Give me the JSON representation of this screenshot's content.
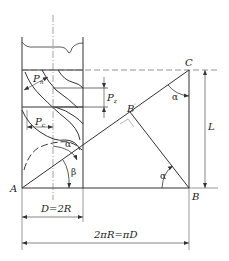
{
  "diagram": {
    "points": {
      "A": "A",
      "B": "B",
      "C": "C",
      "B_prime": "B",
      "B_prime_mark": "′"
    },
    "labels": {
      "Pn_main": "P",
      "Pn_sub": "n",
      "Pz_main": "P",
      "Pz_sub": "z",
      "Pc_main": "P",
      "Pc_sub": "c",
      "L": "L",
      "diameter": "D=2R",
      "circumference": "2πR=πD"
    },
    "angles": {
      "alpha_top": "α",
      "alpha_cyl": "α",
      "alpha_bottom": "α",
      "beta": "β"
    },
    "colors": {
      "line": "#333333",
      "dash": "#666666",
      "background": "#ffffff"
    }
  }
}
